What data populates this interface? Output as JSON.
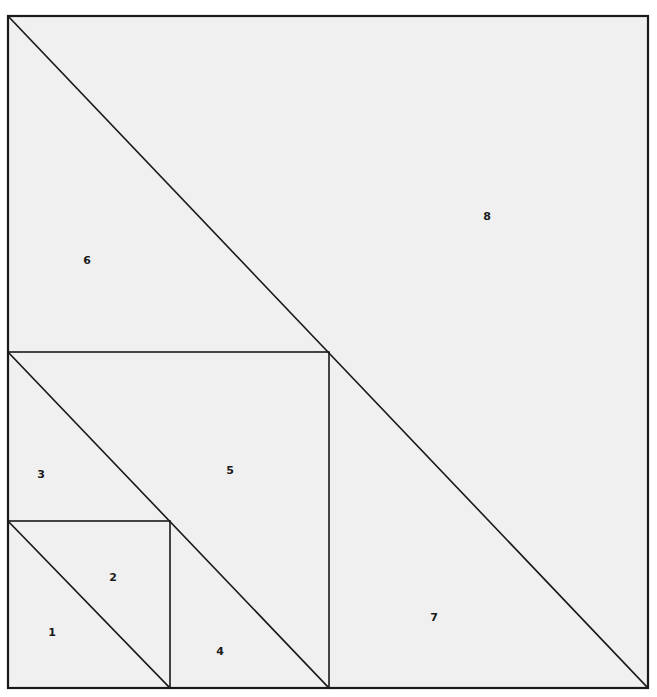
{
  "figure": {
    "canvas": {
      "width": 657,
      "height": 697
    },
    "style": {
      "background_color": "#ffffff",
      "fill_color": "#f0f0f0",
      "stroke_color": "#1a1a1a",
      "outer_stroke_width": 2.2,
      "inner_stroke_width": 1.6,
      "label_color": "#1a1a1a",
      "label_font_size": 11
    },
    "squares": [
      {
        "name": "small-square",
        "x": 8,
        "y": 521,
        "width": 162,
        "height": 167,
        "diagonal": {
          "x1": 8,
          "y1": 521,
          "x2": 170,
          "y2": 688
        },
        "regions": [
          "1",
          "2"
        ]
      },
      {
        "name": "medium-square",
        "x": 8,
        "y": 352,
        "width": 321,
        "height": 336,
        "diagonal": {
          "x1": 8,
          "y1": 352,
          "x2": 329,
          "y2": 688
        },
        "regions": [
          "3",
          "4",
          "5"
        ]
      },
      {
        "name": "outer-square",
        "x": 8,
        "y": 16,
        "width": 640,
        "height": 672,
        "diagonal": {
          "x1": 8,
          "y1": 16,
          "x2": 648,
          "y2": 688
        },
        "regions": [
          "6",
          "7",
          "8"
        ]
      }
    ],
    "regions": [
      {
        "id": "1",
        "label": "1",
        "label_x": 52,
        "label_y": 633,
        "shape": "triangle",
        "points": "8,521 8,688 170,688"
      },
      {
        "id": "2",
        "label": "2",
        "label_x": 113,
        "label_y": 578,
        "shape": "triangle",
        "points": "8,521 170,521 170,688"
      },
      {
        "id": "3",
        "label": "3",
        "label_x": 41,
        "label_y": 475,
        "shape": "triangle",
        "points": "8,352 8,521 170,521"
      },
      {
        "id": "4",
        "label": "4",
        "label_x": 220,
        "label_y": 652,
        "shape": "triangle",
        "points": "170,521 170,688 329,688"
      },
      {
        "id": "5",
        "label": "5",
        "label_x": 230,
        "label_y": 471,
        "shape": "triangle",
        "points": "8,352 329,352 329,688"
      },
      {
        "id": "6",
        "label": "6",
        "label_x": 87,
        "label_y": 261,
        "shape": "triangle",
        "points": "8,16 8,352 329,352"
      },
      {
        "id": "7",
        "label": "7",
        "label_x": 434,
        "label_y": 618,
        "shape": "triangle",
        "points": "329,352 329,688 648,688"
      },
      {
        "id": "8",
        "label": "8",
        "label_x": 487,
        "label_y": 217,
        "shape": "triangle",
        "points": "8,16 648,16 648,688"
      }
    ],
    "edges": [
      {
        "name": "outer-square-border",
        "x": 8,
        "y": 16,
        "width": 640,
        "height": 672,
        "weight": "outer"
      },
      {
        "name": "medium-square-border",
        "x": 8,
        "y": 352,
        "width": 321,
        "height": 336,
        "weight": "inner"
      },
      {
        "name": "small-square-border",
        "x": 8,
        "y": 521,
        "width": 162,
        "height": 167,
        "weight": "inner"
      }
    ]
  }
}
